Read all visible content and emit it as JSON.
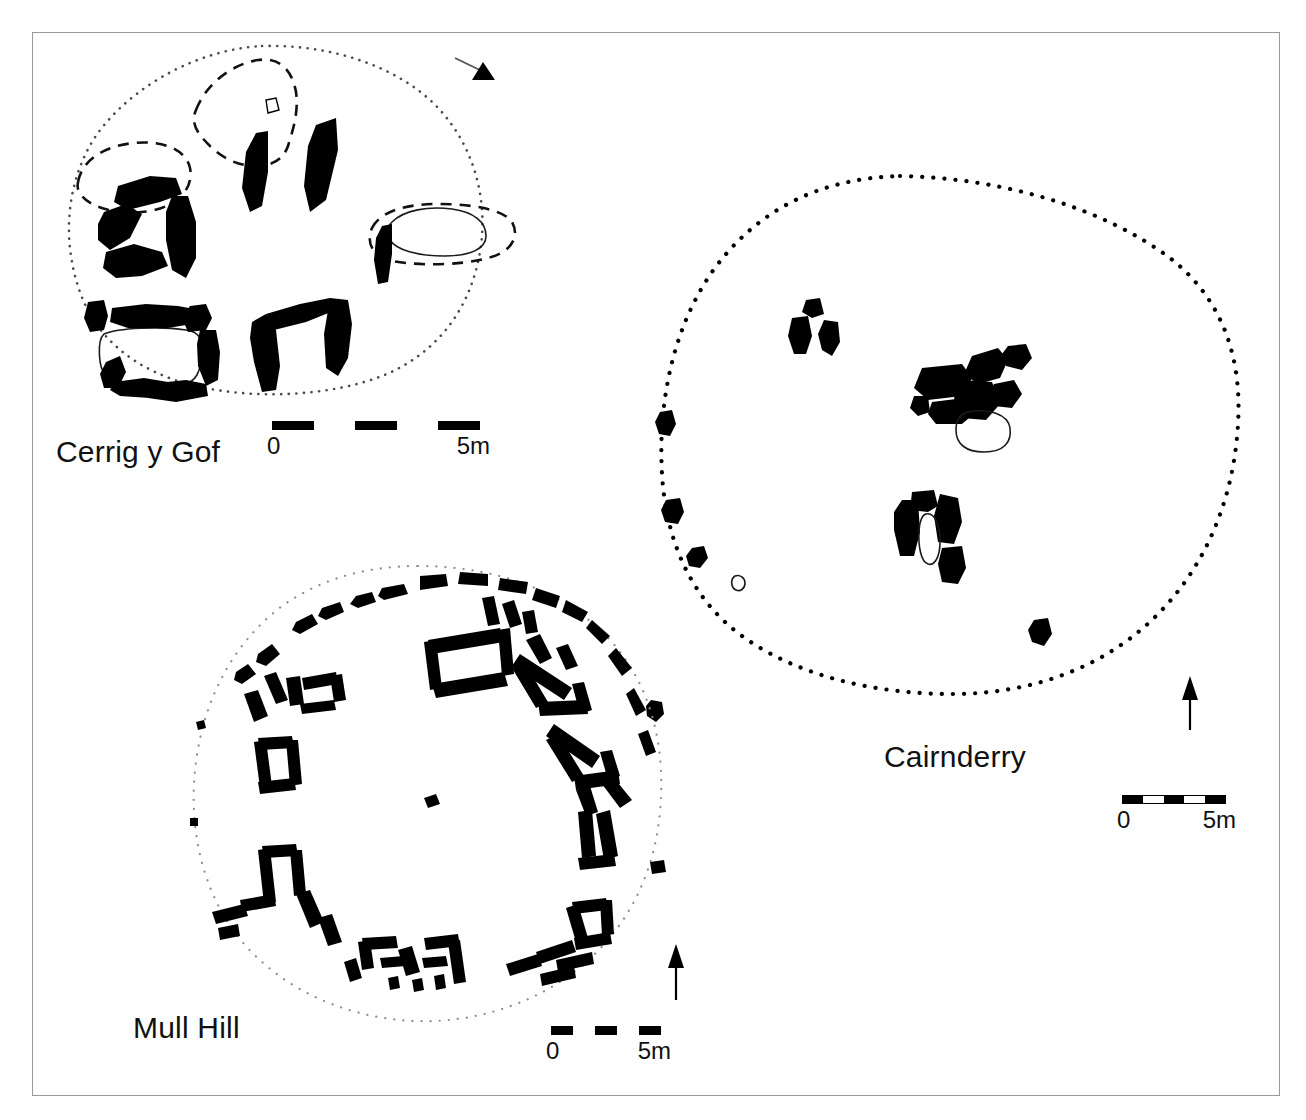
{
  "figure": {
    "kind": "archaeological-site-plans",
    "background": "#ffffff",
    "frame_color": "#9a9a9a",
    "stone_fill": "#000000",
    "plans": [
      {
        "id": "cerrig-y-gof",
        "label": "Cerrig y Gof",
        "monument_type": "multiple-chambered round cairn",
        "cairn_outline_style": "dotted",
        "chamber_outline_style": "dashed",
        "chamber_count": 5,
        "north_arrow": {
          "present": true,
          "style": "diagonal-line-with-solid-triangle",
          "bearing_deg": 55
        },
        "scalebar": {
          "min_label": "0",
          "max_label": "5m",
          "segments": 5,
          "length_m": 5,
          "boxed": false
        }
      },
      {
        "id": "cairnderry",
        "label": "Cairnderry",
        "monument_type": "round cairn with chambers",
        "cairn_outline_style": "dotted",
        "chamber_outline_style": "none",
        "chamber_count": 3,
        "north_arrow": {
          "present": true,
          "style": "vertical-line-with-solid-triangle",
          "bearing_deg": 0
        },
        "scalebar": {
          "min_label": "0",
          "max_label": "5m",
          "segments": 5,
          "length_m": 5,
          "boxed": true
        }
      },
      {
        "id": "mull-hill",
        "label": "Mull Hill",
        "monument_type": "circle of radial chambers",
        "cairn_outline_style": "dotted",
        "chamber_outline_style": "none",
        "chamber_count": 6,
        "north_arrow": {
          "present": true,
          "style": "vertical-line-with-solid-triangle",
          "bearing_deg": 0
        },
        "scalebar": {
          "min_label": "0",
          "max_label": "5m",
          "segments": 5,
          "length_m": 5,
          "boxed": false
        }
      }
    ],
    "legend_keys": [
      {
        "name": "orthostat",
        "appearance": "solid black fill"
      },
      {
        "name": "capstone",
        "appearance": "thin solid outline"
      },
      {
        "name": "chamber-limit",
        "appearance": "dashed line"
      },
      {
        "name": "cairn-edge",
        "appearance": "dotted line"
      }
    ]
  }
}
